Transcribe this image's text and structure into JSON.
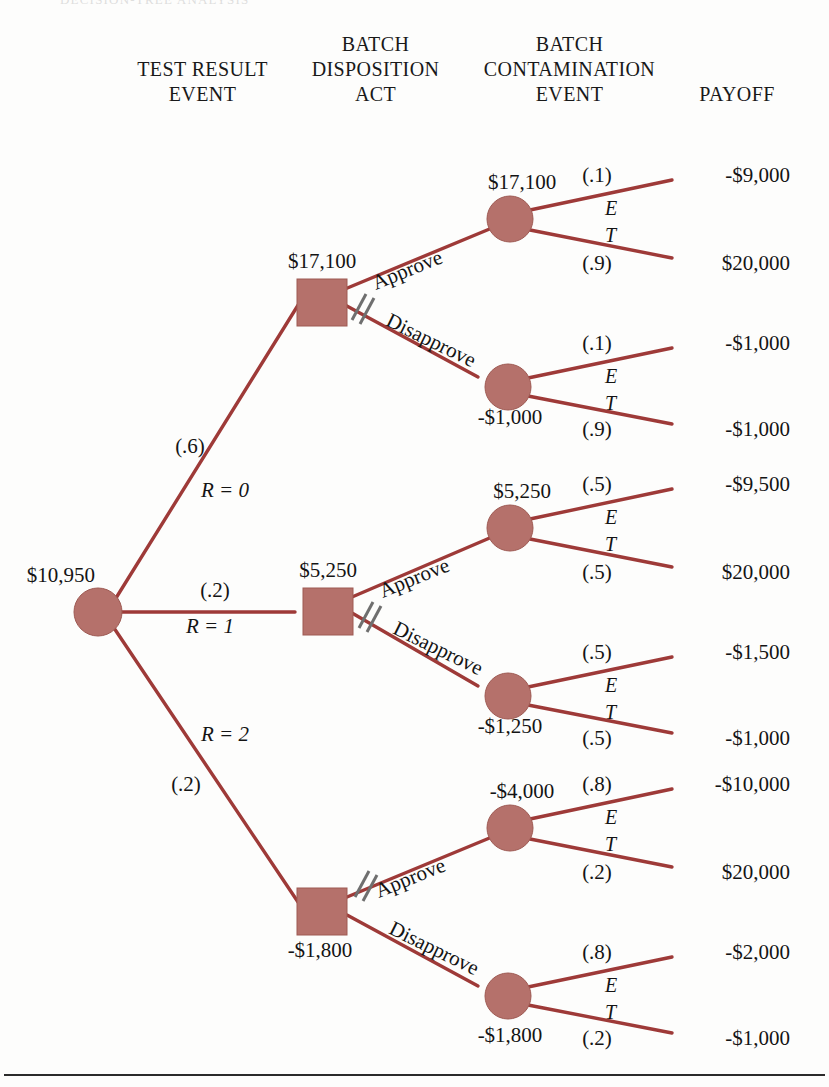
{
  "figure": {
    "clipped_header": "DECISION-TREE ANALYSIS",
    "node_fill": "#b5716b",
    "node_stroke": "#8d4b45",
    "branch_color": "#9e3a38",
    "text_color": "#141414"
  },
  "headers": [
    {
      "id": "test-result-event",
      "text": "TEST RESULT\nEVENT"
    },
    {
      "id": "batch-disposition-act",
      "text": "BATCH\nDISPOSITION\nACT"
    },
    {
      "id": "batch-contamination-event",
      "text": "BATCH\nCONTAMINATION\nEVENT"
    },
    {
      "id": "payoff",
      "text": "PAYOFF"
    }
  ],
  "root": {
    "label": "$10,950",
    "type": "chance"
  },
  "test_result_branches": [
    {
      "id": "r0",
      "prob": "(.6)",
      "event": "R = 0",
      "node_value": "$17,100"
    },
    {
      "id": "r1",
      "prob": "(.2)",
      "event": "R = 1",
      "node_value": "$5,250"
    },
    {
      "id": "r2",
      "prob": "(.2)",
      "event": "R = 2",
      "node_value": "-$1,800"
    }
  ],
  "act_labels": {
    "approve": "Approve",
    "disapprove": "Disapprove",
    "pruned_marker": "//"
  },
  "contamination_labels": {
    "e": "E",
    "t": "T"
  },
  "subtrees": [
    {
      "id": "r0",
      "decision_value": "$17,100",
      "pruned_act": "disapprove",
      "acts": [
        {
          "act": "Approve",
          "chance_value": "$17,100",
          "outcomes": [
            {
              "prob": "(.1)",
              "state": "E",
              "payoff": "-$9,000"
            },
            {
              "prob": "(.9)",
              "state": "T",
              "payoff": "$20,000"
            }
          ]
        },
        {
          "act": "Disapprove",
          "chance_value": "-$1,000",
          "outcomes": [
            {
              "prob": "(.1)",
              "state": "E",
              "payoff": "-$1,000"
            },
            {
              "prob": "(.9)",
              "state": "T",
              "payoff": "-$1,000"
            }
          ]
        }
      ]
    },
    {
      "id": "r1",
      "decision_value": "$5,250",
      "pruned_act": "disapprove",
      "acts": [
        {
          "act": "Approve",
          "chance_value": "$5,250",
          "outcomes": [
            {
              "prob": "(.5)",
              "state": "E",
              "payoff": "-$9,500"
            },
            {
              "prob": "(.5)",
              "state": "T",
              "payoff": "$20,000"
            }
          ]
        },
        {
          "act": "Disapprove",
          "chance_value": "-$1,250",
          "outcomes": [
            {
              "prob": "(.5)",
              "state": "E",
              "payoff": "-$1,500"
            },
            {
              "prob": "(.5)",
              "state": "T",
              "payoff": "-$1,000"
            }
          ]
        }
      ]
    },
    {
      "id": "r2",
      "decision_value": "-$1,800",
      "pruned_act": "approve",
      "acts": [
        {
          "act": "Approve",
          "chance_value": "-$4,000",
          "outcomes": [
            {
              "prob": "(.8)",
              "state": "E",
              "payoff": "-$10,000"
            },
            {
              "prob": "(.2)",
              "state": "T",
              "payoff": "$20,000"
            }
          ]
        },
        {
          "act": "Disapprove",
          "chance_value": "-$1,800",
          "outcomes": [
            {
              "prob": "(.8)",
              "state": "E",
              "payoff": "-$2,000"
            },
            {
              "prob": "(.2)",
              "state": "T",
              "payoff": "-$1,000"
            }
          ]
        }
      ]
    }
  ]
}
